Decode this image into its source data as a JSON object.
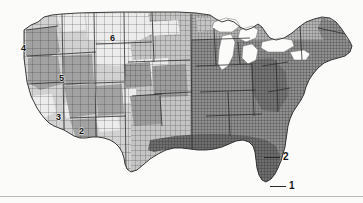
{
  "figure": {
    "background_color": "#fbfbfa",
    "ink_color": "#2b2b2b",
    "width": 363,
    "height": 203
  },
  "map": {
    "region_name": "Contiguous United States",
    "boundary_type": "county",
    "water_features": [
      "Great Lakes"
    ],
    "shading_scheme": "grayscale",
    "shade_values": [
      "#f1f1f1",
      "#dcdcdc",
      "#c2c2c2",
      "#a8a8a8",
      "#8e8e8e",
      "#6f6f6f",
      "#555555"
    ]
  },
  "callouts": [
    {
      "id": "callout-1",
      "label": "1",
      "leader_length": 16,
      "x": 270,
      "y": 181
    },
    {
      "id": "callout-2",
      "label": "2",
      "leader_length": 16,
      "x": 264,
      "y": 152
    }
  ],
  "inset_labels": [
    {
      "id": "inset-label-2",
      "label": "2",
      "x": 79,
      "y": 127
    },
    {
      "id": "inset-label-3",
      "label": "3",
      "x": 56,
      "y": 113
    },
    {
      "id": "inset-label-4",
      "label": "4",
      "x": 21,
      "y": 44
    },
    {
      "id": "inset-label-5",
      "label": "5",
      "x": 59,
      "y": 74
    },
    {
      "id": "inset-label-6",
      "label": "6",
      "x": 110,
      "y": 34
    }
  ]
}
